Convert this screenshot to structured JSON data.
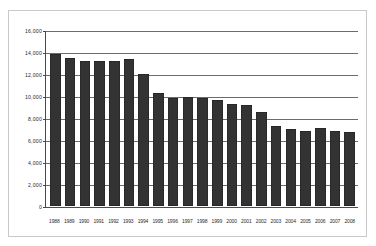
{
  "chart_data": {
    "type": "bar",
    "title": "",
    "subtitle": "",
    "xlabel": "",
    "ylabel": "",
    "ylim": [
      0,
      16000
    ],
    "grid": true,
    "legend": false,
    "legend_position": "none",
    "bar_color": "#333333",
    "gridline_color": "#6b6b6b",
    "axis_color": "#4a4a4a",
    "background_color": "#ffffff",
    "ytick_labels": [
      "16,000",
      "14,000",
      "12,000",
      "10,000",
      "8,000",
      "6,000",
      "4,000",
      "2,000",
      "0"
    ],
    "ytick_values": [
      16000,
      14000,
      12000,
      10000,
      8000,
      6000,
      4000,
      2000,
      0
    ],
    "categories": [
      "1988",
      "1989",
      "1990",
      "1991",
      "1992",
      "1993",
      "1994",
      "1995",
      "1996",
      "1997",
      "1998",
      "1999",
      "2000",
      "2001",
      "2002",
      "2003",
      "2004",
      "2005",
      "2006",
      "2007",
      "2008"
    ],
    "values": [
      13900,
      13500,
      13300,
      13300,
      13300,
      13400,
      12100,
      10300,
      9850,
      10000,
      9850,
      9650,
      9300,
      9200,
      8600,
      7350,
      7000,
      6850,
      7100,
      6850,
      6800
    ]
  }
}
